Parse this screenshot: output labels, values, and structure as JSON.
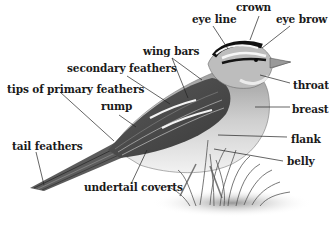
{
  "diagram": {
    "labels": {
      "crown": "crown",
      "eye_line": "eye line",
      "eye_brow": "eye brow",
      "wing_bars": "wing bars",
      "secondary_feathers": "secondary feathers",
      "throat": "throat",
      "tips_of_primary_feathers": "tips of primary feathers",
      "rump": "rump",
      "breast": "breast",
      "flank": "flank",
      "tail_feathers": "tail feathers",
      "belly": "belly",
      "undertail_coverts": "undertail coverts"
    },
    "colors": {
      "background": "#ffffff",
      "text": "#1a1a1a",
      "leader_lines": "#222222",
      "bird_dark": "#2b2b2b",
      "bird_mid": "#8a8a8a",
      "bird_light": "#d9d9d9"
    }
  }
}
